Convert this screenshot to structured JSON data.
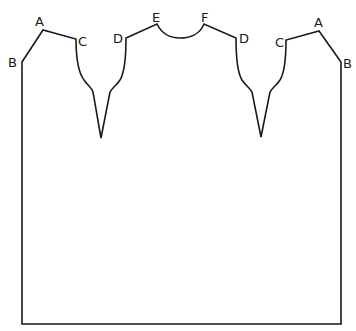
{
  "diagram": {
    "type": "pattern-piece",
    "stroke_color": "#1a1a1a",
    "background": "#ffffff",
    "labels": [
      {
        "id": "A-left",
        "text": "A",
        "x": 41,
        "y": 24
      },
      {
        "id": "B-left",
        "text": "B",
        "x": 15,
        "y": 67
      },
      {
        "id": "C-left",
        "text": "C",
        "x": 83,
        "y": 45
      },
      {
        "id": "D-left",
        "text": "D",
        "x": 119,
        "y": 42
      },
      {
        "id": "E",
        "text": "E",
        "x": 158,
        "y": 20
      },
      {
        "id": "F",
        "text": "F",
        "x": 205,
        "y": 20
      },
      {
        "id": "D-right",
        "text": "D",
        "x": 243,
        "y": 42
      },
      {
        "id": "C-right",
        "text": "C",
        "x": 279,
        "y": 47
      },
      {
        "id": "A-right",
        "text": "A",
        "x": 319,
        "y": 25
      },
      {
        "id": "B-right",
        "text": "B",
        "x": 347,
        "y": 67
      }
    ]
  }
}
